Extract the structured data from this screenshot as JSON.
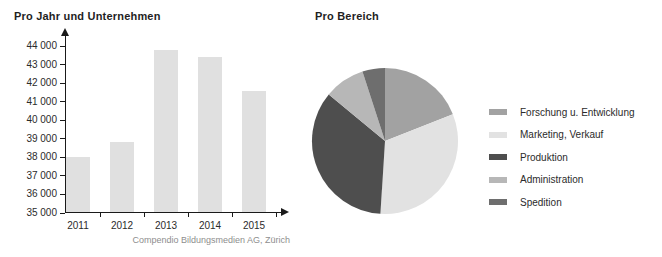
{
  "chart_data": [
    {
      "type": "bar",
      "title": "Pro Jahr und Unternehmen",
      "caption": "Compendio Bildungsmedien AG, Zürich",
      "categories": [
        "2011",
        "2012",
        "2013",
        "2014",
        "2015"
      ],
      "values": [
        38000,
        38800,
        43800,
        43400,
        41600
      ],
      "xlabel": "",
      "ylabel": "",
      "ylim": [
        35000,
        44000
      ],
      "ytick_step": 1000,
      "ytick_labels": [
        "35 000",
        "36 000",
        "37 000",
        "38 000",
        "39 000",
        "40 000",
        "41 000",
        "42 000",
        "43 000",
        "44 000"
      ],
      "grid": false,
      "bar_color": "#e0e0e0",
      "axis_color": "#1a1a1a"
    },
    {
      "type": "pie",
      "title": "Pro Bereich",
      "start_angle_deg": 0,
      "direction": "clockwise",
      "legend_position": "right",
      "slices": [
        {
          "label": "Forschung u. Entwicklung",
          "percent": 19,
          "color": "#a2a2a2"
        },
        {
          "label": "Marketing, Verkauf",
          "percent": 32,
          "color": "#e2e2e2"
        },
        {
          "label": "Produktion",
          "percent": 35,
          "color": "#4e4e4e"
        },
        {
          "label": "Administration",
          "percent": 9,
          "color": "#b7b7b7"
        },
        {
          "label": "Spedition",
          "percent": 5,
          "color": "#6e6e6e"
        }
      ]
    }
  ]
}
